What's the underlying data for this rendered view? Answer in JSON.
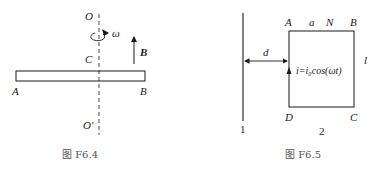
{
  "figure_left": {
    "caption": "图 F6.4",
    "labels": {
      "O": "O",
      "O_prime": "O'",
      "C": "C",
      "A": "A",
      "B_end": "B",
      "omega": "ω",
      "B_field": "B"
    },
    "elements": [
      "rod AB",
      "dashed rotation axis OO'",
      "rotation arrow ω",
      "magnetic field arrow B"
    ]
  },
  "figure_right": {
    "caption": "图 F6.5",
    "labels": {
      "A": "A",
      "a": "a",
      "N": "N",
      "B": "B",
      "C": "C",
      "D": "D",
      "l": "l",
      "d": "d",
      "wire_1": "1",
      "loop_2": "2",
      "current": "i=i₀cos(ωt)"
    },
    "elements": [
      "long straight wire 1",
      "rectangular loop ABCD (2)",
      "distance arrow d",
      "current arrow"
    ]
  },
  "colors": {
    "line": "#1a1a1a",
    "caption": "#555555",
    "background": "#ffffff"
  }
}
